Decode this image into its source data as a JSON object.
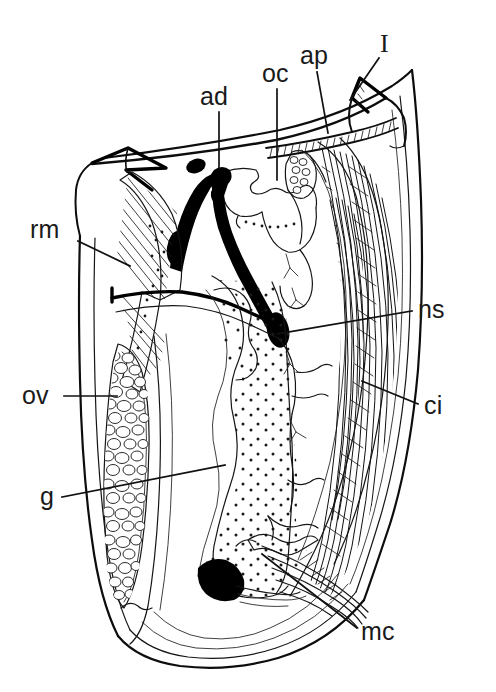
{
  "figure": {
    "type": "anatomical-line-drawing",
    "background_color": "#ffffff",
    "ink_color": "#111111",
    "width": 496,
    "height": 692
  },
  "labels": [
    {
      "key": "ad",
      "text": "ad",
      "meaning": "adductor muscle",
      "text_x": 200,
      "text_y": 105,
      "anchor": "start",
      "leader": "M 219 112 L 219 168",
      "style": "sans"
    },
    {
      "key": "oc",
      "text": "oc",
      "meaning": "ocular region",
      "text_x": 262,
      "text_y": 82,
      "anchor": "start",
      "leader": "M 277 89 L 277 180",
      "style": "sans"
    },
    {
      "key": "ap",
      "text": "ap",
      "meaning": "antennal/appendage process",
      "text_x": 300,
      "text_y": 64,
      "anchor": "start",
      "leader": "M 317 72 L 328 133",
      "style": "sans"
    },
    {
      "key": "I",
      "text": "I",
      "meaning": "first antenna",
      "text_x": 380,
      "text_y": 52,
      "anchor": "start",
      "leader": "M 379 58 L 350 100",
      "style": "serif"
    },
    {
      "key": "rm",
      "text": "rm",
      "meaning": "retractor muscle",
      "text_x": 30,
      "text_y": 238,
      "anchor": "start",
      "leader": "M 78 241 L 130 266",
      "style": "sans"
    },
    {
      "key": "ns",
      "text": "ns",
      "meaning": "nervous system / nerve strand",
      "text_x": 418,
      "text_y": 318,
      "anchor": "start",
      "leader": "M 412 311 L 277 334",
      "style": "sans"
    },
    {
      "key": "ci",
      "text": "ci",
      "meaning": "cirri / thoracic limbs",
      "text_x": 424,
      "text_y": 414,
      "anchor": "start",
      "leader": "M 418 404 L 362 381",
      "style": "sans"
    },
    {
      "key": "ov",
      "text": "ov",
      "meaning": "ovary",
      "text_x": 22,
      "text_y": 404,
      "anchor": "start",
      "leader": "M 64 396 L 117 396",
      "style": "sans"
    },
    {
      "key": "g",
      "text": "g",
      "meaning": "gut",
      "text_x": 40,
      "text_y": 505,
      "anchor": "start",
      "leader": "M 62 497 L 225 465",
      "style": "sans"
    },
    {
      "key": "mc",
      "text": "mc",
      "meaning": "mandibular coxa / muscle complex",
      "text_x": 361,
      "text_y": 640,
      "anchor": "start",
      "leader": "M 357 628 L 262 554",
      "style": "sans"
    }
  ],
  "regions": {
    "ovary": {
      "name": "ov",
      "texture": "vesicular-cells"
    },
    "gut": {
      "name": "g",
      "texture": "stipple-dots"
    },
    "cirri": {
      "name": "ci",
      "texture": "dense-hatching"
    },
    "retractor_muscle": {
      "name": "rm",
      "texture": "parallel-hatching"
    },
    "adductor": {
      "name": "ad",
      "texture": "solid-black"
    }
  }
}
